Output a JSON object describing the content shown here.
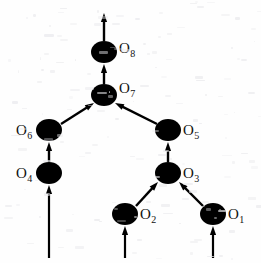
{
  "figure": {
    "width": 261,
    "height": 263,
    "background_color": "#fefefe",
    "ink_color": "#000000",
    "label_color": "#111111"
  },
  "nodes": [
    {
      "id": "O1",
      "label_base": "O",
      "label_sub": "1",
      "cx": 213,
      "cy": 214,
      "rx": 13,
      "ry": 11,
      "label_x": 228,
      "label_y": 207,
      "label_side": "right"
    },
    {
      "id": "O2",
      "label_base": "O",
      "label_sub": "2",
      "cx": 125,
      "cy": 214,
      "rx": 13,
      "ry": 11,
      "label_x": 140,
      "label_y": 207,
      "label_side": "right"
    },
    {
      "id": "O3",
      "label_base": "O",
      "label_sub": "3",
      "cx": 168,
      "cy": 173,
      "rx": 13,
      "ry": 11,
      "label_x": 183,
      "label_y": 166,
      "label_side": "right"
    },
    {
      "id": "O4",
      "label_base": "O",
      "label_sub": "4",
      "cx": 49,
      "cy": 173,
      "rx": 13,
      "ry": 11,
      "label_x": 16,
      "label_y": 166,
      "label_side": "left"
    },
    {
      "id": "O5",
      "label_base": "O",
      "label_sub": "5",
      "cx": 168,
      "cy": 130,
      "rx": 13,
      "ry": 11,
      "label_x": 183,
      "label_y": 123,
      "label_side": "right"
    },
    {
      "id": "O6",
      "label_base": "O",
      "label_sub": "6",
      "cx": 49,
      "cy": 130,
      "rx": 13,
      "ry": 11,
      "label_x": 16,
      "label_y": 123,
      "label_side": "left"
    },
    {
      "id": "O7",
      "label_base": "O",
      "label_sub": "7",
      "cx": 104,
      "cy": 95,
      "rx": 13,
      "ry": 11,
      "label_x": 119,
      "label_y": 81,
      "label_side": "right"
    },
    {
      "id": "O8",
      "label_base": "O",
      "label_sub": "8",
      "cx": 104,
      "cy": 52,
      "rx": 13,
      "ry": 11,
      "label_x": 119,
      "label_y": 41,
      "label_side": "right"
    }
  ],
  "edges": [
    {
      "id": "in-O4",
      "from": "input",
      "to": "O4",
      "x1": 49,
      "y1": 258,
      "x2": 49,
      "y2": 185,
      "kind": "input-arrow"
    },
    {
      "id": "in-O2",
      "from": "input",
      "to": "O2",
      "x1": 125,
      "y1": 258,
      "x2": 125,
      "y2": 226,
      "kind": "input-arrow"
    },
    {
      "id": "in-O1",
      "from": "input",
      "to": "O1",
      "x1": 213,
      "y1": 258,
      "x2": 213,
      "y2": 226,
      "kind": "input-arrow"
    },
    {
      "id": "O4-O6",
      "from": "O4",
      "to": "O6",
      "x1": 49,
      "y1": 162,
      "x2": 49,
      "y2": 142,
      "kind": "edge-arrow"
    },
    {
      "id": "O2-O3",
      "from": "O2",
      "to": "O3",
      "x1": 136,
      "y1": 206,
      "x2": 158,
      "y2": 182,
      "kind": "edge-arrow"
    },
    {
      "id": "O1-O3",
      "from": "O1",
      "to": "O3",
      "x1": 203,
      "y1": 206,
      "x2": 179,
      "y2": 182,
      "kind": "edge-arrow"
    },
    {
      "id": "O3-O5",
      "from": "O3",
      "to": "O5",
      "x1": 168,
      "y1": 162,
      "x2": 168,
      "y2": 142,
      "kind": "edge-arrow"
    },
    {
      "id": "O6-O7",
      "from": "O6",
      "to": "O7",
      "x1": 61,
      "y1": 124,
      "x2": 94,
      "y2": 103,
      "kind": "edge-arrow"
    },
    {
      "id": "O5-O7",
      "from": "O5",
      "to": "O7",
      "x1": 157,
      "y1": 124,
      "x2": 115,
      "y2": 103,
      "kind": "edge-arrow"
    },
    {
      "id": "O7-O8",
      "from": "O7",
      "to": "O8",
      "x1": 104,
      "y1": 84,
      "x2": 104,
      "y2": 64,
      "kind": "edge-arrow"
    },
    {
      "id": "O8-out",
      "from": "O8",
      "to": "output",
      "x1": 104,
      "y1": 41,
      "x2": 104,
      "y2": 13,
      "kind": "output-arrow"
    }
  ]
}
